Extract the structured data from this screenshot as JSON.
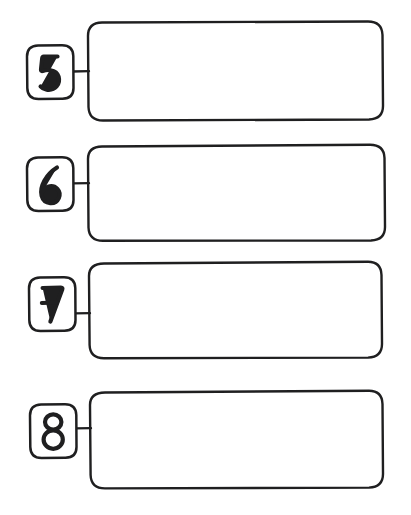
{
  "page": {
    "background_color": "#ffffff",
    "ink_color": "#1f1f20",
    "width": 411,
    "height": 515,
    "style": "hand-drawn"
  },
  "rows": [
    {
      "number": "5",
      "badge_name": "number-badge-5",
      "box_name": "answer-box-5",
      "connector_name": "connector-line-5",
      "content": "",
      "badge": {
        "x": 27,
        "y": 45,
        "width": 46,
        "height": 54,
        "radius": 11
      },
      "box": {
        "x": 88,
        "y": 22,
        "width": 295,
        "height": 98,
        "radius": 14
      },
      "connector": {
        "x1": 73,
        "y1": 71,
        "x2": 89,
        "y2": 71
      }
    },
    {
      "number": "6",
      "badge_name": "number-badge-6",
      "box_name": "answer-box-6",
      "connector_name": "connector-line-6",
      "content": "",
      "badge": {
        "x": 27,
        "y": 157,
        "width": 46,
        "height": 54,
        "radius": 11
      },
      "box": {
        "x": 88,
        "y": 145,
        "width": 297,
        "height": 96,
        "radius": 14
      },
      "connector": {
        "x1": 73,
        "y1": 183,
        "x2": 89,
        "y2": 183
      }
    },
    {
      "number": "7",
      "badge_name": "number-badge-7",
      "box_name": "answer-box-7",
      "connector_name": "connector-line-7",
      "content": "",
      "badge": {
        "x": 29,
        "y": 277,
        "width": 46,
        "height": 54,
        "radius": 11
      },
      "box": {
        "x": 90,
        "y": 262,
        "width": 292,
        "height": 96,
        "radius": 14
      },
      "connector": {
        "x1": 75,
        "y1": 313,
        "x2": 91,
        "y2": 313
      }
    },
    {
      "number": "8",
      "badge_name": "number-badge-8",
      "box_name": "answer-box-8",
      "connector_name": "connector-line-8",
      "content": "",
      "badge": {
        "x": 30,
        "y": 404,
        "width": 46,
        "height": 54,
        "radius": 11
      },
      "box": {
        "x": 91,
        "y": 391,
        "width": 292,
        "height": 97,
        "radius": 14
      },
      "connector": {
        "x1": 76,
        "y1": 428,
        "x2": 92,
        "y2": 428
      }
    }
  ]
}
